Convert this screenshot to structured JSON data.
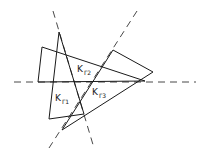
{
  "diagram": {
    "labels": [
      {
        "id": "k-gamma-2",
        "main": "K",
        "sub": "Γ2"
      },
      {
        "id": "k-gamma-1",
        "main": "K",
        "sub": "Γ1"
      },
      {
        "id": "k-gamma-3",
        "main": "K",
        "sub": "Γ3"
      }
    ],
    "line_color": "#1a1a1a",
    "background": "#ffffff"
  }
}
